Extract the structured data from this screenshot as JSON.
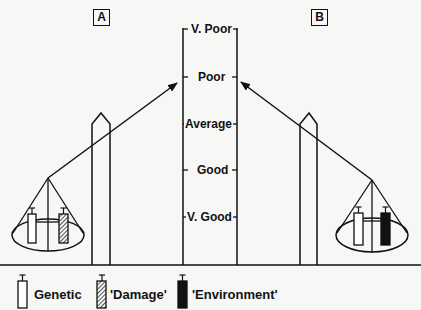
{
  "panels": {
    "a": {
      "label": "A"
    },
    "b": {
      "label": "B"
    }
  },
  "scale": {
    "levels": [
      {
        "label": "V. Poor",
        "y": 29
      },
      {
        "label": "Poor",
        "y": 77
      },
      {
        "label": "Average",
        "y": 124
      },
      {
        "label": "Good",
        "y": 170
      },
      {
        "label": "V. Good",
        "y": 217
      }
    ]
  },
  "legend": {
    "items": [
      {
        "label": "Genetic",
        "fill": "white"
      },
      {
        "label": "'Damage'",
        "fill": "hatched"
      },
      {
        "label": "'Environment'",
        "fill": "black"
      }
    ]
  },
  "balances": {
    "a": {
      "weights": [
        "Genetic",
        "'Damage'"
      ],
      "pointer_level": "Poor"
    },
    "b": {
      "weights": [
        "Genetic",
        "'Environment'"
      ],
      "pointer_level": "Poor"
    }
  },
  "colors": {
    "ink": "#111111",
    "background": "#f7f7f5"
  }
}
